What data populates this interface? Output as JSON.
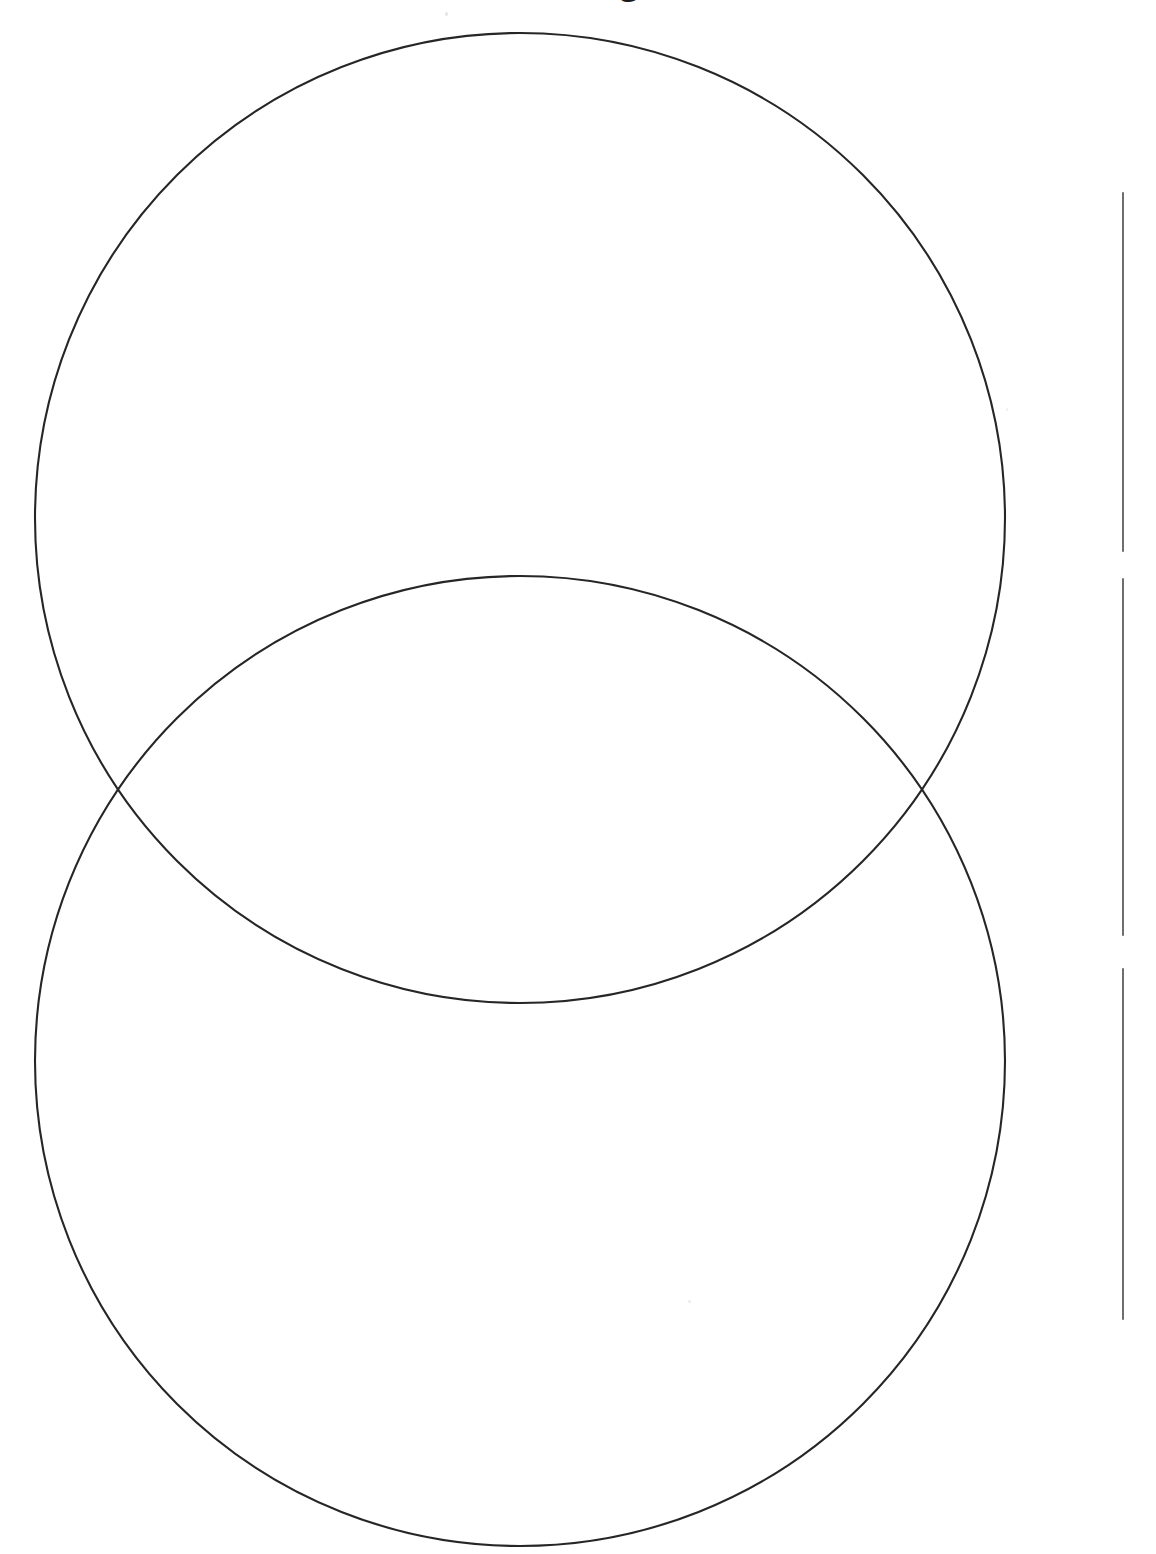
{
  "page": {
    "title": "Venn Diagram",
    "width": 1156,
    "height": 1554,
    "background_color": "#ffffff",
    "ink_color": "#262626",
    "rule_color": "#6e6e6e"
  },
  "header": {
    "title_text": "Venn Diagram",
    "note": "title is cropped by the top edge of the page; only the descender/baseline of the bold heading is visible"
  },
  "diagram": {
    "type": "venn",
    "orientation": "vertical",
    "set_count": 2,
    "stroke_color": "#262626",
    "stroke_width": 2,
    "fill": "none",
    "circles": [
      {
        "id": "upper-circle",
        "label": "",
        "center_x": 520,
        "center_y": 518,
        "radius": 485,
        "top_y": 33,
        "bottom_y": 1003,
        "left_x": 35,
        "right_x": 1005
      },
      {
        "id": "lower-circle",
        "label": "",
        "center_x": 520,
        "center_y": 1061,
        "radius": 485,
        "top_y": 576,
        "bottom_y": 1546,
        "left_x": 35,
        "right_x": 1005
      }
    ],
    "intersection_points": [
      {
        "x": 110,
        "y": 793
      },
      {
        "x": 945,
        "y": 793
      }
    ],
    "regions": [
      {
        "id": "upper-only",
        "label": "",
        "center_x": 520,
        "center_y": 310
      },
      {
        "id": "overlap",
        "label": "",
        "center_x": 520,
        "center_y": 792
      },
      {
        "id": "lower-only",
        "label": "",
        "center_x": 520,
        "center_y": 1270
      }
    ]
  },
  "writing_lines": {
    "orientation": "vertical",
    "x": 1123,
    "color": "#6e6e6e",
    "thickness": 2,
    "lines": [
      {
        "id": "line-1",
        "top": 192,
        "bottom": 552,
        "length": 360
      },
      {
        "id": "line-2",
        "top": 578,
        "bottom": 936,
        "length": 358
      },
      {
        "id": "line-3",
        "top": 968,
        "bottom": 1320,
        "length": 352
      }
    ]
  },
  "artifacts": {
    "specks": [
      {
        "id": "speck-a",
        "x": 445,
        "y": 12
      },
      {
        "id": "speck-b",
        "x": 688,
        "y": 1300
      },
      {
        "id": "speck-c",
        "x": 1006,
        "y": 408
      }
    ]
  }
}
